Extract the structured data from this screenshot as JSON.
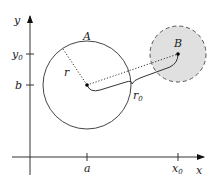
{
  "diagram": {
    "axes": {
      "x_label": "x",
      "y_label": "y"
    },
    "ticks": {
      "x": [
        {
          "id": "a",
          "text": "a"
        },
        {
          "id": "x0",
          "base": "x",
          "subscript": "0"
        }
      ],
      "y": [
        {
          "id": "y0",
          "base": "y",
          "subscript": "0"
        },
        {
          "id": "b",
          "text": "b"
        }
      ]
    },
    "circles": {
      "A": {
        "label": "A",
        "style": "solid outline, no fill"
      },
      "B": {
        "label": "B",
        "style": "dashed outline, gray fill"
      }
    },
    "radius_label": "r",
    "distance_label": {
      "base": "r",
      "subscript": "0"
    },
    "colors": {
      "line": "#333333",
      "fill_B": "#e0e0e0",
      "background": "#ffffff"
    }
  }
}
